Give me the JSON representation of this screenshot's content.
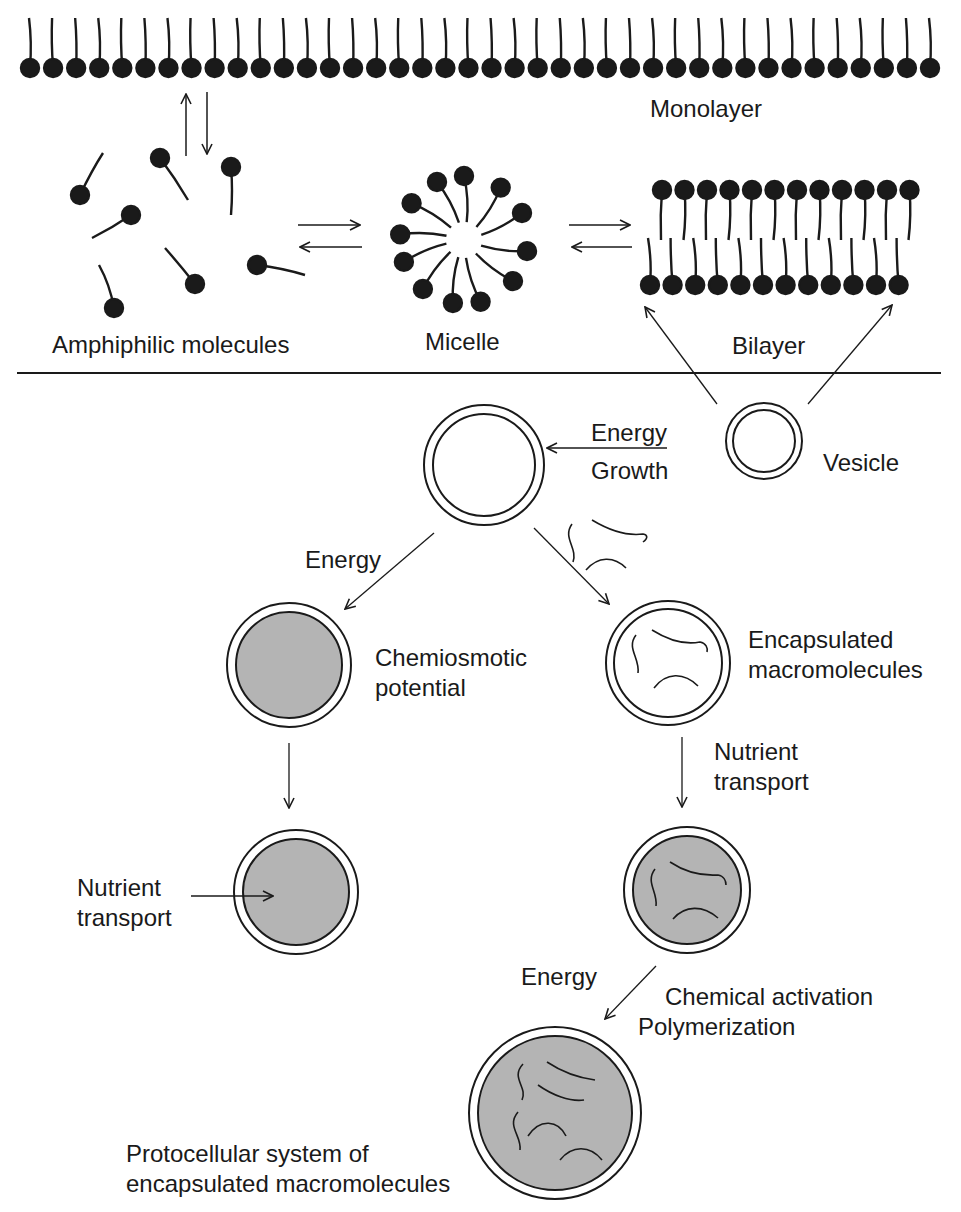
{
  "figure": {
    "colors": {
      "ink": "#1a1a1a",
      "fill_gray": "#b4b4b4",
      "background": "#ffffff"
    },
    "top_panel": {
      "monolayer": {
        "label": "Monolayer",
        "lipid_count": 40
      },
      "amphiphilic": {
        "label": "Amphiphilic molecules",
        "molecule_count": 8
      },
      "micelle": {
        "label": "Micelle",
        "lipid_count": 12
      },
      "bilayer": {
        "label": "Bilayer",
        "lipids_per_leaflet": 12
      },
      "equilibria": [
        {
          "from": "Amphiphilic molecules",
          "to": "Monolayer",
          "type": "reversible"
        },
        {
          "from": "Amphiphilic molecules",
          "to": "Micelle",
          "type": "reversible"
        },
        {
          "from": "Micelle",
          "to": "Bilayer",
          "type": "reversible"
        }
      ]
    },
    "bottom_panel": {
      "vesicle": {
        "label": "Vesicle"
      },
      "growth_arrow": {
        "label_top": "Energy",
        "label_bottom": "Growth"
      },
      "left_branch": {
        "energy_label": "Energy",
        "chemiosmotic": {
          "line1": "Chemiosmotic",
          "line2": "potential"
        },
        "nutrient": {
          "line1": "Nutrient",
          "line2": "transport"
        }
      },
      "right_branch": {
        "encapsulated": {
          "line1": "Encapsulated",
          "line2": "macromolecules"
        },
        "nutrient": {
          "line1": "Nutrient",
          "line2": "transport"
        },
        "energy_label": "Energy",
        "activation": {
          "line1": "Chemical activation",
          "line2": "Polymerization"
        }
      },
      "protocell": {
        "line1": "Protocellular system of",
        "line2": "encapsulated macromolecules"
      }
    }
  }
}
